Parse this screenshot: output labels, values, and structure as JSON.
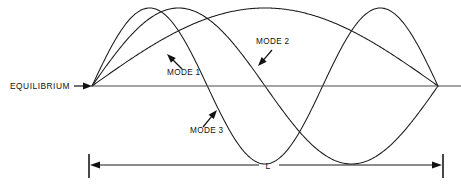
{
  "figure": {
    "background_color": "#ffffff",
    "curve_color": "#1a1a1a",
    "axis_color": "#4a4a4a",
    "text_color": "#111111",
    "width": 461,
    "height": 190
  },
  "axis": {
    "label": "EQUILIBRIUM",
    "label_x": 10,
    "label_y": 89,
    "line_x1": 92,
    "line_x2": 461,
    "line_y": 86,
    "pointer_x1": 74,
    "pointer_x2": 90,
    "pointer_y": 86
  },
  "string": {
    "left_node_x": 92,
    "right_node_x": 438,
    "baseline_y": 86,
    "amplitude": 78
  },
  "labels": [
    {
      "id": "mode-1",
      "text": "MODE 1",
      "text_x": 167,
      "text_y": 75,
      "pointer_from_x": 182,
      "pointer_from_y": 69,
      "pointer_to_x": 167,
      "pointer_to_y": 54,
      "arrow_angle_deg": 225
    },
    {
      "id": "mode-2",
      "text": "MODE 2",
      "text_x": 256,
      "text_y": 44,
      "pointer_from_x": 272,
      "pointer_from_y": 50,
      "pointer_to_x": 258,
      "pointer_to_y": 66,
      "arrow_angle_deg": 133
    },
    {
      "id": "mode-3",
      "text": "MODE 3",
      "text_x": 190,
      "text_y": 133,
      "pointer_from_x": 203,
      "pointer_from_y": 127,
      "pointer_to_x": 217,
      "pointer_to_y": 110,
      "arrow_angle_deg": 310
    }
  ],
  "dimension": {
    "label": "L",
    "label_x": 268,
    "label_y": 169,
    "y": 165,
    "x1": 89,
    "x2": 443,
    "tick_top": 154,
    "tick_bottom": 178,
    "gap_left": 259,
    "gap_right": 279
  },
  "chart_data": {
    "type": "line",
    "xlabel": "",
    "ylabel": "",
    "x_domain": [
      0,
      1
    ],
    "y_domain": [
      -1,
      1
    ],
    "grid": false,
    "legend": "inline-annotations",
    "annotations": [
      "EQUILIBRIUM",
      "MODE 1",
      "MODE 2",
      "MODE 3",
      "L"
    ],
    "series": [
      {
        "name": "MODE 1",
        "harmonic": 1,
        "formula": "y = A*sin(1*pi*x/L)",
        "nodes": [
          0,
          1
        ],
        "antinodes": [
          0.5
        ],
        "peak_x_px": 265,
        "peak_y_px": 8,
        "amplitude": 1.0,
        "color": "#1a1a1a"
      },
      {
        "name": "MODE 2",
        "harmonic": 2,
        "formula": "y = A*sin(2*pi*x/L)",
        "nodes": [
          0,
          0.5,
          1
        ],
        "antinodes": [
          0.25,
          0.75
        ],
        "peak_x_px": 180,
        "peak_y_px": 8,
        "trough_x_px": 352,
        "trough_y_px": 152,
        "amplitude": 1.0,
        "color": "#1a1a1a"
      },
      {
        "name": "MODE 3",
        "harmonic": 3,
        "formula": "y = A*sin(3*pi*x/L)",
        "nodes": [
          0,
          0.3333,
          0.6667,
          1
        ],
        "antinodes": [
          0.1667,
          0.5,
          0.8333
        ],
        "peak_x_px": 150,
        "peak_y_px": 10,
        "trough_x_px": 265,
        "trough_y_px": 152,
        "second_peak_x_px": 380,
        "second_peak_y_px": 12,
        "amplitude": 1.0,
        "color": "#1a1a1a"
      }
    ]
  }
}
